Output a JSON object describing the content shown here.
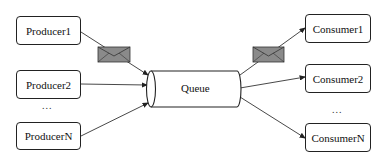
{
  "producers": [
    {
      "label": "Producer1"
    },
    {
      "label": "Producer2"
    },
    {
      "label": "ProducerN"
    }
  ],
  "producers_ellipsis": "...",
  "queue": {
    "label": "Queue"
  },
  "consumers": [
    {
      "label": "Consumer1"
    },
    {
      "label": "Consumer2"
    },
    {
      "label": "ConsumerN"
    }
  ],
  "consumers_ellipsis": "...",
  "colors": {
    "line": "#222222",
    "envelope_fill": "#8a8a8a",
    "background": "#ffffff"
  }
}
